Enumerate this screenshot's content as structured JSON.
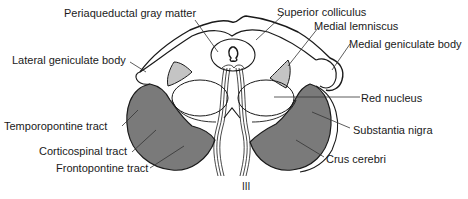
{
  "diagram": {
    "type": "anatomical-cross-section",
    "colors": {
      "outline": "#1a1a1a",
      "crus_fill": "#7a7a7a",
      "medial_lemniscus_fill": "#c4c4c4",
      "background": "#ffffff"
    },
    "labels": {
      "periaqueductal": "Periaqueductal gray matter",
      "superior_colliculus": "Superior colliculus",
      "medial_lemniscus": "Medial lemniscus",
      "lateral_geniculate": "Lateral geniculate body",
      "medial_geniculate": "Medial geniculate body",
      "red_nucleus": "Red nucleus",
      "temporopontine": "Temporopontine tract",
      "substantia_nigra": "Substantia nigra",
      "corticospinal": "Corticospinal tract",
      "frontopontine": "Frontopontine tract",
      "crus_cerebri": "Crus cerebri",
      "nerve_iii": "III"
    }
  }
}
